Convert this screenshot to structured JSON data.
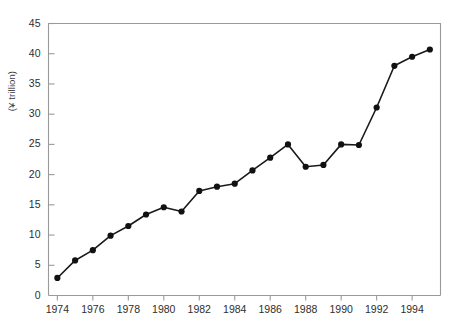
{
  "chart_data": {
    "type": "line",
    "title": "",
    "xlabel": "",
    "ylabel": "(¥ trillion)",
    "xlim": [
      1973.5,
      1995.6
    ],
    "ylim": [
      0,
      45
    ],
    "grid": false,
    "legend": null,
    "x": [
      1974,
      1975,
      1976,
      1977,
      1978,
      1979,
      1980,
      1981,
      1982,
      1983,
      1984,
      1985,
      1986,
      1987,
      1988,
      1989,
      1990,
      1991,
      1992,
      1993,
      1994,
      1995
    ],
    "values": [
      2.9,
      5.8,
      7.5,
      9.9,
      11.5,
      13.4,
      14.6,
      13.9,
      17.3,
      18.0,
      18.5,
      20.7,
      22.8,
      25.0,
      21.3,
      21.6,
      25.0,
      24.9,
      31.1,
      38.0,
      39.5,
      40.7
    ],
    "xticks": [
      1974,
      1976,
      1978,
      1980,
      1982,
      1984,
      1986,
      1988,
      1990,
      1992,
      1994
    ],
    "xtick_labels": [
      "1974",
      "1976",
      "1978",
      "1980",
      "1982",
      "1984",
      "1986",
      "1988",
      "1990",
      "1992",
      "1994"
    ],
    "yticks": [
      0,
      5,
      10,
      15,
      20,
      25,
      30,
      35,
      40,
      45
    ],
    "ytick_labels": [
      "0",
      "5",
      "10",
      "15",
      "20",
      "25",
      "30",
      "35",
      "40",
      "45"
    ],
    "line_color": "#1a1a1a",
    "marker": "circle",
    "marker_color": "#111111",
    "axis_color": "#9a9a9a"
  },
  "figure": {
    "caption": ""
  }
}
